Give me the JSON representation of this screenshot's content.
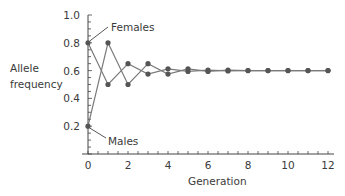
{
  "chart_data": {
    "type": "line",
    "title": "",
    "xlabel": "Generation",
    "ylabel": "Allele frequency",
    "x": [
      0,
      1,
      2,
      3,
      4,
      5,
      6,
      7,
      8,
      9,
      10,
      11,
      12
    ],
    "series": [
      {
        "name": "Females",
        "values": [
          0.8,
          0.5,
          0.65,
          0.575,
          0.6125,
          0.594,
          0.603,
          0.598,
          0.6,
          0.6,
          0.6,
          0.6,
          0.6
        ]
      },
      {
        "name": "Males",
        "values": [
          0.2,
          0.8,
          0.5,
          0.65,
          0.575,
          0.6125,
          0.594,
          0.603,
          0.6,
          0.6,
          0.6,
          0.6,
          0.6
        ]
      }
    ],
    "xticks": [
      "0",
      "2",
      "4",
      "6",
      "8",
      "10",
      "12"
    ],
    "yticks": [
      "0.2",
      "0.4",
      "0.6",
      "0.8",
      "1.0"
    ],
    "xlim": [
      0,
      12
    ],
    "ylim": [
      0,
      1.0
    ],
    "grid": false,
    "legend": "inline annotations",
    "annotations": [
      "Females",
      "Males"
    ]
  },
  "labels": {
    "ylabel_line1": "Allele",
    "ylabel_line2": "frequency",
    "xlabel": "Generation",
    "females": "Females",
    "males": "Males"
  },
  "colors": {
    "line": "#7a7a7a",
    "marker": "#555555",
    "axis": "#444444"
  }
}
